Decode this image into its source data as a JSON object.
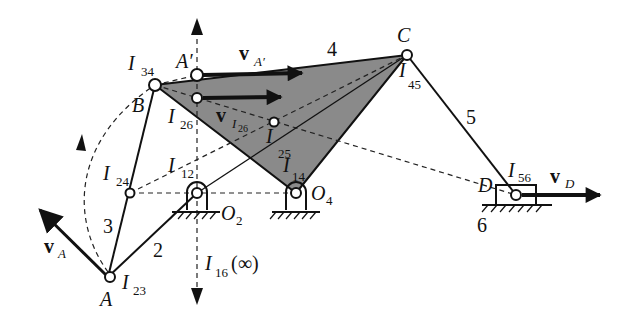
{
  "figure": {
    "shaded_link_color": "#8a8a8a",
    "line_color": "#111111",
    "points": {
      "A": {
        "label": "A",
        "x": 108,
        "y": 277
      },
      "B": {
        "label": "B",
        "x": 155,
        "y": 85
      },
      "A_prime": {
        "label": "A'",
        "x": 197,
        "y": 75
      },
      "C": {
        "label": "C",
        "x": 407,
        "y": 55
      },
      "D": {
        "label": "D",
        "x": 516,
        "y": 195
      },
      "O2": {
        "label": "O",
        "sub": "2",
        "x": 196,
        "y": 193
      },
      "O4": {
        "label": "O",
        "sub": "4",
        "x": 296,
        "y": 193
      },
      "I24": {
        "x": 130,
        "y": 193
      },
      "I25": {
        "x": 274,
        "y": 122
      },
      "I26": {
        "x": 197,
        "y": 98
      }
    },
    "instant_centers": [
      {
        "name": "I",
        "sub": "34"
      },
      {
        "name": "I",
        "sub": "26"
      },
      {
        "name": "I",
        "sub": "25"
      },
      {
        "name": "I",
        "sub": "24"
      },
      {
        "name": "I",
        "sub": "12"
      },
      {
        "name": "I",
        "sub": "14"
      },
      {
        "name": "I",
        "sub": "45"
      },
      {
        "name": "I",
        "sub": "56"
      },
      {
        "name": "I",
        "sub": "23"
      },
      {
        "name": "I",
        "sub": "16",
        "suffix": "(∞)"
      }
    ],
    "link_numbers": [
      "2",
      "3",
      "4",
      "5",
      "6"
    ],
    "velocities": [
      {
        "name": "v",
        "sub": "A'"
      },
      {
        "name": "v",
        "sub": "I26"
      },
      {
        "name": "v",
        "sub": "A"
      },
      {
        "name": "v",
        "sub": "D"
      }
    ],
    "labels": {
      "A": "A",
      "A_prime": "A′",
      "B": "B",
      "C": "C",
      "D": "D",
      "O": "O",
      "O2_sub": "2",
      "O4_sub": "4",
      "I": "I",
      "I34_sub": "34",
      "I26_sub": "26",
      "I25_sub": "25",
      "I24_sub": "24",
      "I12_sub": "12",
      "I14_sub": "14",
      "I45_sub": "45",
      "I56_sub": "56",
      "I23_sub": "23",
      "I16_sub": "16",
      "I16_suffix": "(∞)",
      "v": "v",
      "vA_sub": "A",
      "vAp_sub": "A′",
      "vI26_sub": "I",
      "vI26_subsub": "26",
      "vD_sub": "D",
      "link2": "2",
      "link3": "3",
      "link4": "4",
      "link5": "5",
      "link6": "6"
    }
  }
}
